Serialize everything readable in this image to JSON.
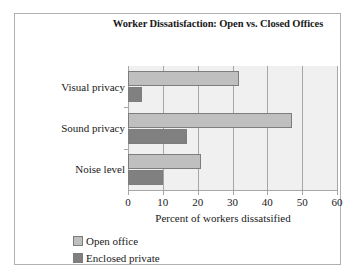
{
  "chart_data": {
    "type": "bar",
    "orientation": "horizontal",
    "title": "Worker Dissatisfaction: Open vs. Closed Offices",
    "xlabel": "Percent of workers dissatsified",
    "ylabel": "",
    "categories": [
      "Visual privacy",
      "Sound privacy",
      "Noise level"
    ],
    "series": [
      {
        "name": "Open office",
        "values": [
          32,
          47,
          21
        ],
        "color": "#bfbfbf"
      },
      {
        "name": "Enclosed private",
        "values": [
          4,
          17,
          10
        ],
        "color": "#808080"
      }
    ],
    "xlim": [
      0,
      60
    ],
    "xticks": [
      0,
      10,
      20,
      30,
      40,
      50,
      60
    ],
    "xtick_labels": [
      "0",
      "10",
      "20",
      "30",
      "40",
      "50",
      "60"
    ],
    "grid": "vertical",
    "legend_position": "bottom-left",
    "plot_background": "#f0f0f0",
    "axis_color": "#a6a6a6",
    "border_color": "#b0b0b0"
  }
}
